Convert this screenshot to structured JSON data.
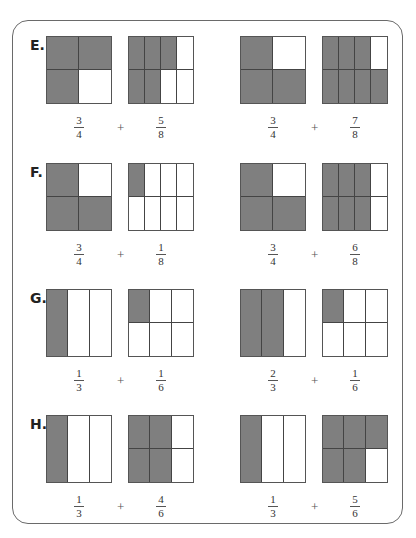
{
  "shade_color": "#7f7f7f",
  "problems": [
    {
      "label": "E.",
      "pairs": [
        {
          "a": {
            "num": "3",
            "den": "4",
            "rows": 2,
            "cols": 2,
            "shaded": [
              0,
              1,
              2
            ]
          },
          "b": {
            "num": "5",
            "den": "8",
            "rows": 2,
            "cols": 4,
            "shaded": [
              0,
              1,
              2,
              4,
              5
            ]
          }
        },
        {
          "a": {
            "num": "3",
            "den": "4",
            "rows": 2,
            "cols": 2,
            "shaded": [
              0,
              2,
              3
            ]
          },
          "b": {
            "num": "7",
            "den": "8",
            "rows": 2,
            "cols": 4,
            "shaded": [
              0,
              1,
              2,
              4,
              5,
              6,
              7
            ]
          }
        }
      ]
    },
    {
      "label": "F.",
      "pairs": [
        {
          "a": {
            "num": "3",
            "den": "4",
            "rows": 2,
            "cols": 2,
            "shaded": [
              0,
              2,
              3
            ]
          },
          "b": {
            "num": "1",
            "den": "8",
            "rows": 2,
            "cols": 4,
            "shaded": [
              0
            ]
          }
        },
        {
          "a": {
            "num": "3",
            "den": "4",
            "rows": 2,
            "cols": 2,
            "shaded": [
              0,
              2,
              3
            ]
          },
          "b": {
            "num": "6",
            "den": "8",
            "rows": 2,
            "cols": 4,
            "shaded": [
              0,
              1,
              2,
              4,
              5,
              6
            ]
          }
        }
      ]
    },
    {
      "label": "G.",
      "pairs": [
        {
          "a": {
            "num": "1",
            "den": "3",
            "rows": 1,
            "cols": 3,
            "shaded": [
              0
            ]
          },
          "b": {
            "num": "1",
            "den": "6",
            "rows": 2,
            "cols": 3,
            "shaded": [
              0
            ]
          }
        },
        {
          "a": {
            "num": "2",
            "den": "3",
            "rows": 1,
            "cols": 3,
            "shaded": [
              0,
              1
            ]
          },
          "b": {
            "num": "1",
            "den": "6",
            "rows": 2,
            "cols": 3,
            "shaded": [
              0
            ]
          }
        }
      ]
    },
    {
      "label": "H.",
      "pairs": [
        {
          "a": {
            "num": "1",
            "den": "3",
            "rows": 1,
            "cols": 3,
            "shaded": [
              0
            ]
          },
          "b": {
            "num": "4",
            "den": "6",
            "rows": 2,
            "cols": 3,
            "shaded": [
              0,
              1,
              3,
              4
            ]
          }
        },
        {
          "a": {
            "num": "1",
            "den": "3",
            "rows": 1,
            "cols": 3,
            "shaded": [
              0
            ]
          },
          "b": {
            "num": "5",
            "den": "6",
            "rows": 2,
            "cols": 3,
            "shaded": [
              0,
              1,
              2,
              3,
              4
            ]
          }
        }
      ]
    }
  ],
  "operator": "+"
}
